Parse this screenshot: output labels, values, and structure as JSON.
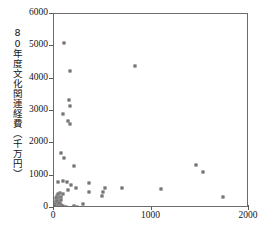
{
  "chart_data": {
    "type": "scatter",
    "title": "",
    "ylabel": "80年度文化関連経費（千万円）",
    "xlabel": "",
    "xlim": [
      0,
      2000
    ],
    "ylim": [
      0,
      6000
    ],
    "xticks": [
      0,
      1000,
      2000
    ],
    "xtick_labels": [
      "0",
      "1000",
      "2000"
    ],
    "yticks": [
      0,
      1000,
      2000,
      3000,
      4000,
      5000,
      6000
    ],
    "ytick_labels": [
      "0",
      "1000",
      "2000",
      "3000",
      "4000",
      "5000",
      "6000"
    ],
    "grid": false,
    "legend": null,
    "marker": "open-square",
    "series": [
      {
        "name": "自治体",
        "points": [
          [
            105,
            5100
          ],
          [
            165,
            4250
          ],
          [
            155,
            3350
          ],
          [
            165,
            3150
          ],
          [
            90,
            2900
          ],
          [
            140,
            2700
          ],
          [
            165,
            2600
          ],
          [
            830,
            4400
          ],
          [
            70,
            1700
          ],
          [
            100,
            1550
          ],
          [
            210,
            1300
          ],
          [
            1455,
            1330
          ],
          [
            1530,
            1120
          ],
          [
            1730,
            330
          ],
          [
            40,
            790
          ],
          [
            90,
            850
          ],
          [
            130,
            790
          ],
          [
            175,
            700
          ],
          [
            230,
            620
          ],
          [
            140,
            560
          ],
          [
            360,
            780
          ],
          [
            360,
            480
          ],
          [
            500,
            510
          ],
          [
            490,
            360
          ],
          [
            520,
            610
          ],
          [
            700,
            630
          ],
          [
            1100,
            590
          ],
          [
            60,
            450
          ],
          [
            95,
            430
          ],
          [
            70,
            350
          ],
          [
            55,
            330
          ],
          [
            45,
            300
          ],
          [
            35,
            360
          ],
          [
            30,
            270
          ],
          [
            50,
            230
          ],
          [
            75,
            250
          ],
          [
            40,
            190
          ],
          [
            25,
            170
          ],
          [
            60,
            150
          ],
          [
            30,
            120
          ],
          [
            20,
            230
          ],
          [
            45,
            100
          ],
          [
            70,
            80
          ],
          [
            25,
            60
          ],
          [
            55,
            40
          ],
          [
            35,
            30
          ],
          [
            15,
            110
          ],
          [
            12,
            60
          ],
          [
            90,
            60
          ],
          [
            200,
            60
          ],
          [
            300,
            110
          ],
          [
            240,
            30
          ],
          [
            65,
            15
          ],
          [
            120,
            20
          ],
          [
            20,
            300
          ],
          [
            38,
            420
          ],
          [
            28,
            210
          ],
          [
            48,
            140
          ]
        ]
      }
    ]
  }
}
